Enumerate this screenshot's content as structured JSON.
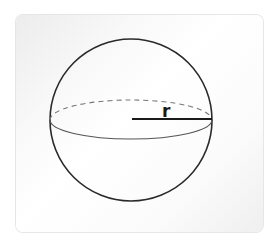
{
  "diagram": {
    "title": "",
    "shape": "sphere",
    "radius_label": "r",
    "colors": {
      "outline": "#2a2a2a",
      "equator_front": "#555555",
      "equator_back": "#777777",
      "radius_line": "#1a1a1a",
      "card_bg": "#f7f7f7"
    }
  }
}
